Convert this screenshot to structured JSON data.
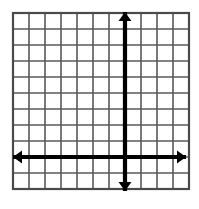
{
  "figure": {
    "title": "Blank Cartesian coordinate grid",
    "description": "An empty square grid of 11 by 11 cells with a bold vertical y-axis and a bold horizontal x-axis, each drawn as a double-headed arrow extending past the grid border.",
    "background_color": "#ffffff",
    "grid_line_color": "#595959",
    "grid_border_color": "#4a4a4a",
    "axis_color": "#000000"
  },
  "chart_data": {
    "type": "scatter",
    "title": "",
    "xlabel": "",
    "ylabel": "",
    "x": [],
    "y": [],
    "series": [],
    "annotations": [],
    "legend": [],
    "grid": true,
    "legend_position": "none",
    "xlim": [
      -7,
      4
    ],
    "ylim": [
      -2,
      9
    ],
    "xticks": [
      -7,
      -6,
      -5,
      -4,
      -3,
      -2,
      -1,
      0,
      1,
      2,
      3,
      4
    ],
    "yticks": [
      -2,
      -1,
      0,
      1,
      2,
      3,
      4,
      5,
      6,
      7,
      8,
      9
    ],
    "xtick_labels": [
      "",
      "",
      "",
      "",
      "",
      "",
      "",
      "",
      "",
      "",
      "",
      ""
    ],
    "ytick_labels": [
      "",
      "",
      "",
      "",
      "",
      "",
      "",
      "",
      "",
      "",
      "",
      ""
    ],
    "columns": 11,
    "rows": 11
  },
  "grid_geometry": {
    "left": 13,
    "top": 13,
    "cell_size": 16,
    "columns": 11,
    "rows": 11,
    "right": 189,
    "bottom": 189,
    "grid_line_width": 1.6,
    "border_line_width": 2.2
  },
  "axes": {
    "origin_x": 125,
    "origin_y": 157,
    "axis_line_width": 4.2,
    "x_axis": {
      "label": "x-axis",
      "y": 157,
      "start_x": 13,
      "end_x": 186,
      "arrow_start": true,
      "arrow_end": true,
      "arrow_size": 9
    },
    "y_axis": {
      "label": "y-axis",
      "x": 125,
      "start_y": 191,
      "end_y": 12,
      "arrow_start": true,
      "arrow_end": true,
      "arrow_size": 9
    }
  }
}
